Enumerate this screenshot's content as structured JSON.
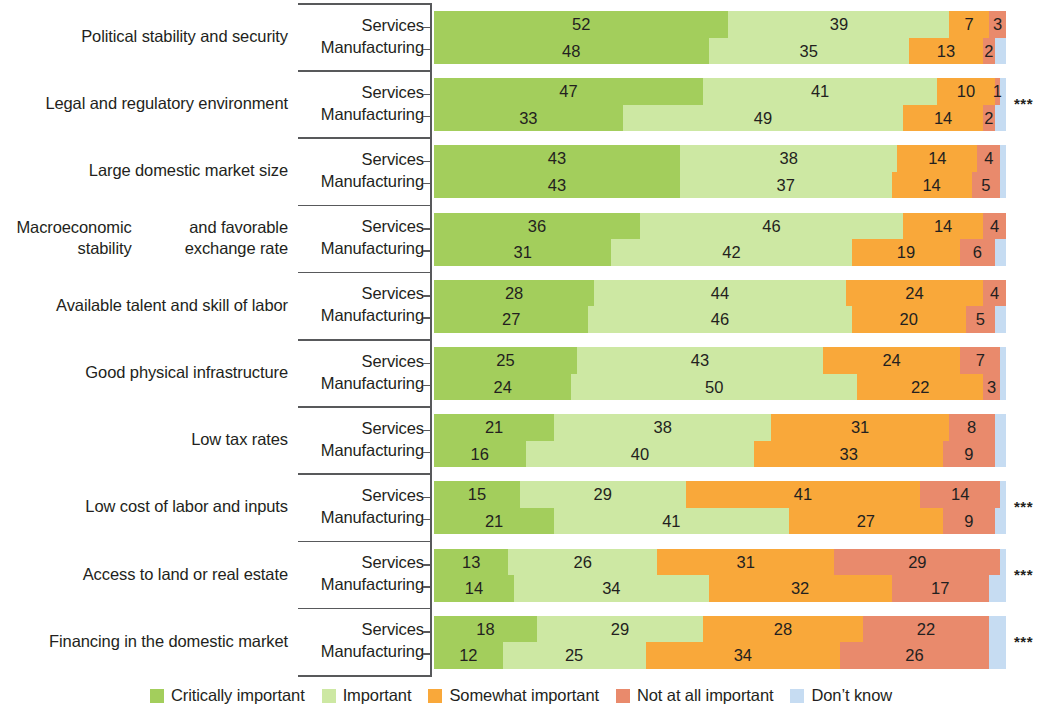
{
  "chart_data": {
    "type": "bar",
    "subtype": "100% stacked horizontal bar, grouped",
    "title": "",
    "subtitle": "",
    "xlabel": "",
    "ylabel": "",
    "xlim": [
      0,
      100
    ],
    "grid": false,
    "legend_position": "bottom-center",
    "series_names": [
      "Services",
      "Manufacturing"
    ],
    "legend": [
      {
        "label": "Critically important",
        "color": "#a3ce5c"
      },
      {
        "label": "Important",
        "color": "#cde8a3"
      },
      {
        "label": "Somewhat important",
        "color": "#f9a83a"
      },
      {
        "label": "Not at all important",
        "color": "#e98a6c"
      },
      {
        "label": "Don’t know",
        "color": "#c6dcf2"
      }
    ],
    "categories": [
      "Political stability and security",
      "Legal and regulatory environment",
      "Large domestic market size",
      "Macroeconomic stability and favorable exchange rate",
      "Available talent and skill of labor",
      "Good physical infrastructure",
      "Low tax rates",
      "Low cost of labor and inputs",
      "Access to land or real estate",
      "Financing in the domestic market"
    ],
    "significance_marker": "***",
    "rows": [
      {
        "category": "Political stability and security",
        "category_lines": [
          "Political stability and security"
        ],
        "significance": "",
        "services": {
          "values": [
            52,
            39,
            7,
            3,
            0
          ]
        },
        "manufacturing": {
          "values": [
            48,
            35,
            13,
            2,
            2
          ]
        }
      },
      {
        "category": "Legal and regulatory environment",
        "category_lines": [
          "Legal and regulatory environment"
        ],
        "significance": "***",
        "services": {
          "values": [
            47,
            41,
            10,
            1,
            1
          ]
        },
        "manufacturing": {
          "values": [
            33,
            49,
            14,
            2,
            2
          ]
        }
      },
      {
        "category": "Large domestic market size",
        "category_lines": [
          "Large domestic market size"
        ],
        "significance": "",
        "services": {
          "values": [
            43,
            38,
            14,
            4,
            1
          ]
        },
        "manufacturing": {
          "values": [
            43,
            37,
            14,
            5,
            1
          ]
        }
      },
      {
        "category": "Macroeconomic stability and favorable exchange rate",
        "category_lines": [
          "Macroeconomic stability",
          "and favorable exchange rate"
        ],
        "significance": "",
        "services": {
          "values": [
            36,
            46,
            14,
            4,
            0
          ]
        },
        "manufacturing": {
          "values": [
            31,
            42,
            19,
            6,
            2
          ]
        }
      },
      {
        "category": "Available talent and skill of labor",
        "category_lines": [
          "Available talent and skill of labor"
        ],
        "significance": "",
        "services": {
          "values": [
            28,
            44,
            24,
            4,
            0
          ]
        },
        "manufacturing": {
          "values": [
            27,
            46,
            20,
            5,
            2
          ]
        }
      },
      {
        "category": "Good physical infrastructure",
        "category_lines": [
          "Good physical infrastructure"
        ],
        "significance": "",
        "services": {
          "values": [
            25,
            43,
            24,
            7,
            1
          ]
        },
        "manufacturing": {
          "values": [
            24,
            50,
            22,
            3,
            1
          ]
        }
      },
      {
        "category": "Low tax rates",
        "category_lines": [
          "Low tax rates"
        ],
        "significance": "",
        "services": {
          "values": [
            21,
            38,
            31,
            8,
            2
          ]
        },
        "manufacturing": {
          "values": [
            16,
            40,
            33,
            9,
            2
          ]
        }
      },
      {
        "category": "Low cost of labor and inputs",
        "category_lines": [
          "Low cost of labor and inputs"
        ],
        "significance": "***",
        "services": {
          "values": [
            15,
            29,
            41,
            14,
            1
          ]
        },
        "manufacturing": {
          "values": [
            21,
            41,
            27,
            9,
            2
          ]
        }
      },
      {
        "category": "Access to land or real estate",
        "category_lines": [
          "Access to land or real estate"
        ],
        "significance": "***",
        "services": {
          "values": [
            13,
            26,
            31,
            29,
            1
          ]
        },
        "manufacturing": {
          "values": [
            14,
            34,
            32,
            17,
            3
          ]
        }
      },
      {
        "category": "Financing in the domestic market",
        "category_lines": [
          "Financing in the domestic market"
        ],
        "significance": "***",
        "services": {
          "values": [
            18,
            29,
            28,
            22,
            3
          ]
        },
        "manufacturing": {
          "values": [
            12,
            25,
            34,
            26,
            3
          ]
        }
      }
    ]
  }
}
